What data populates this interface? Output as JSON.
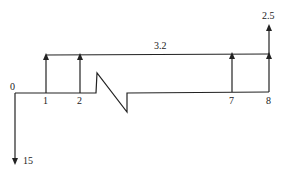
{
  "diagram": {
    "type": "cash-flow",
    "period_labels": [
      "0",
      "1",
      "2",
      "7",
      "8"
    ],
    "uniform_series_value": "3.2",
    "final_extra_value": "2.5",
    "initial_outflow_value": "15",
    "colors": {
      "line": "#222222",
      "background": "#ffffff"
    }
  }
}
